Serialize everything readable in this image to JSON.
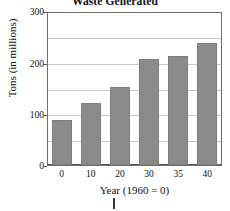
{
  "chart_data": {
    "type": "bar",
    "title": "Waste Generated",
    "xlabel": "Year (1960 = 0)",
    "ylabel": "Tons (in millions)",
    "categories": [
      "0",
      "10",
      "20",
      "30",
      "35",
      "40"
    ],
    "values": [
      88,
      120,
      152,
      207,
      212,
      237
    ],
    "ylim": [
      0,
      300
    ],
    "yticks": [
      "0",
      "100",
      "200",
      "300"
    ],
    "ygridlines": [
      0,
      50,
      100,
      150,
      200,
      250,
      300
    ],
    "grid": true,
    "legend": "none",
    "bar_color": "#8a8a8a",
    "grid_color": "#c9c9c9",
    "axis_color": "#555555"
  },
  "annotation": {
    "caret": "text-cursor"
  }
}
